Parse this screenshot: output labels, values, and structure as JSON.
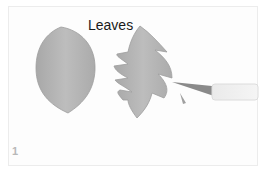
{
  "title": "Leaves",
  "step_number": "1",
  "colors": {
    "leaf": "#b5b5b5",
    "leaf_shadow": "#9d9d9d",
    "background": "#fdfdfd"
  },
  "objects": [
    "plain-leaf-cutout",
    "serrated-leaf-cutout",
    "craft-knife"
  ]
}
